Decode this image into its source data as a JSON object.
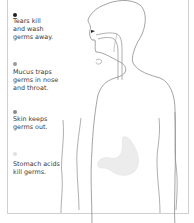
{
  "labels": [
    {
      "text_line1": "Tears kill",
      "text_line2": "and wash",
      "text_line3": "germs away.",
      "dot_color": "#222222"
    },
    {
      "text_line1": "Mucus traps",
      "text_line2": "germs in nose",
      "text_line3": "and throat.",
      "dot_color": "#9a9a9a"
    },
    {
      "text_line1": "Skin keeps",
      "text_line2": "germs out.",
      "text_line3": "",
      "dot_color": "#8a8a8a"
    },
    {
      "text_line1": "Stomach acids",
      "text_line2": "kill germs.",
      "text_line3": "",
      "dot_color": "#e0e0e0"
    }
  ],
  "colors": {
    "outline": "#8c8c8c",
    "stomach_fill": "#ececec",
    "frame": "#d0d0d0",
    "text": "#3a3a3a"
  }
}
